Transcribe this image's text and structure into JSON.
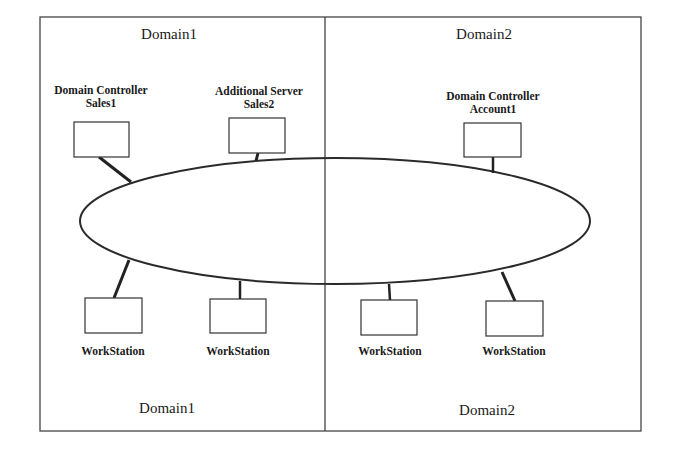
{
  "diagram": {
    "colors": {
      "line": "#2a2a2a",
      "frame": "#444444",
      "background": "#ffffff"
    },
    "domains": [
      {
        "id": "domain1",
        "top_label": "Domain1",
        "bottom_label": "Domain1"
      },
      {
        "id": "domain2",
        "top_label": "Domain2",
        "bottom_label": "Domain2"
      }
    ],
    "network": {
      "shape": "ellipse",
      "label": ""
    },
    "nodes": [
      {
        "id": "dc-sales1",
        "domain": "domain1",
        "label_line1": "Domain Controller",
        "label_line2": "Sales1",
        "label_position": "above"
      },
      {
        "id": "as-sales2",
        "domain": "domain1",
        "label_line1": "Additional Server",
        "label_line2": "Sales2",
        "label_position": "above"
      },
      {
        "id": "dc-account1",
        "domain": "domain2",
        "label_line1": "Domain Controller",
        "label_line2": "Account1",
        "label_position": "above"
      },
      {
        "id": "ws1",
        "domain": "domain1",
        "label_line1": "WorkStation",
        "label_position": "below"
      },
      {
        "id": "ws2",
        "domain": "domain1",
        "label_line1": "WorkStation",
        "label_position": "below"
      },
      {
        "id": "ws3",
        "domain": "domain2",
        "label_line1": "WorkStation",
        "label_position": "below"
      },
      {
        "id": "ws4",
        "domain": "domain2",
        "label_line1": "WorkStation",
        "label_position": "below"
      }
    ]
  }
}
